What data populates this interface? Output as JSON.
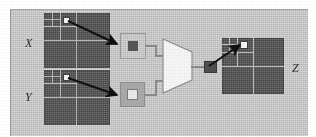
{
  "figure": {
    "kind": "diagram",
    "caption_text": "",
    "background_color": "#ffffff",
    "panel_color": "#c9c9c9"
  },
  "labels": {
    "x": "X",
    "y": "Y",
    "z": "Z"
  },
  "blocks": [
    {
      "id": "x-image",
      "label": "X",
      "role": "input-quadtree-image",
      "fill_color": "#595959",
      "grid_color": "#b9b9b9",
      "marked_node": "top-left-leaf",
      "marked_node_color": "#f2f2f2"
    },
    {
      "id": "y-image",
      "label": "Y",
      "role": "input-quadtree-image",
      "fill_color": "#595959",
      "grid_color": "#b9b9b9",
      "marked_node": "top-left-leaf",
      "marked_node_color": "#f2f2f2"
    },
    {
      "id": "z-image",
      "label": "Z",
      "role": "output-quadtree-image",
      "fill_color": "#595959",
      "grid_color": "#b9b9b9",
      "marked_node": "top-left-leaf",
      "marked_node_color": "#f2f2f2"
    }
  ],
  "nodes": {
    "x_node": {
      "role": "extracted-node-from-x",
      "style": "outlined",
      "outline_color": "#9b9b9b",
      "inner_color": "#555555"
    },
    "y_node": {
      "role": "extracted-node-from-y",
      "style": "filled",
      "fill_color": "#a8a8a8",
      "inner_color": "#e8e8e8"
    },
    "z_node": {
      "role": "combined-result-node",
      "fill_color": "#4f4f4f"
    }
  },
  "combiner": {
    "id": "multiplexer",
    "shape": "trapezoid",
    "label": "",
    "fill_color": "#f4f4f4",
    "stroke_color": "#8f8f8f",
    "inputs": 2,
    "outputs": 1
  },
  "wires": {
    "color": "#8a8a8a",
    "routing": "orthogonal-stepped",
    "count": 3
  },
  "arrows": {
    "color": "#111111",
    "head": "solid-triangle",
    "items": [
      {
        "from": "x-image.top-left-leaf",
        "to": "x_node",
        "direction": "down-right"
      },
      {
        "from": "y-image.top-left-leaf",
        "to": "y_node",
        "direction": "down-right"
      },
      {
        "from": "z_node",
        "to": "z-image.top-left-leaf",
        "direction": "up-right"
      }
    ]
  }
}
